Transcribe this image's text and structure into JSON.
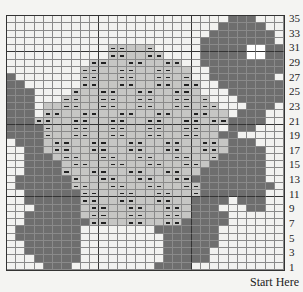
{
  "chart": {
    "cols": 30,
    "rows_count": 35,
    "legend_codes": {
      ".": "background",
      "D": "turtle body (dark)",
      "L": "shell (light)",
      "-": "shell purl stitch",
      "W": "eye (white)"
    },
    "row_labels": [
      "35",
      "33",
      "31",
      "29",
      "27",
      "25",
      "23",
      "21",
      "19",
      "17",
      "15",
      "13",
      "11",
      "9",
      "7",
      "5",
      "3",
      "1"
    ],
    "start_label": "Start Here",
    "rows": [
      "........................DDD...",
      ".......................DDDDD..",
      "......................DDDDDDD.",
      ".....................DDDDDDDD.",
      "...........--LL-.....DDDDDWWDD",
      "...........--LL--....DDDDDWWDD",
      ".........--LL--LL--..DDDDDDDDD",
      "........--LL--LL--LL..DDDDDDDD",
      "D.......--LL--LL--L-..DDDDDDD.",
      "DD......--LL--LL--L--..DDDDDDD",
      "DDD....-LL--LL--LL--L...DDDDDD",
      "DDD...--LL--LL--LL--L-...DDDDD",
      "DDD.LL--LL--LL--LL--L--...DDD.",
      "DDD.--LL--LL--LL--LL--LL.DDD..",
      "DDD--LL--LL--LL--LL--L--DDDD..",
      "DDDD-LL--LL--LL--LL--LL.DDD...",
      "DDDD-LL--LL--LL--LL--LLDD.....",
      ".DDDL--LL--LL--LL--LL--LDDD...",
      "..DDL--LL--LL--LL--LL--LDDDD..",
      "..DDDL--LL--LL--LL--LL-DDDDD..",
      "..DDDDL--LL--LL--LL--LDDDDDD..",
      "..DDDD-LL--LL--LL--LLDDDDDDD..",
      ".DDDDDD-LL--LL--LL--DDDDDDDD..",
      ".DDDDDD--LL--LL--LL--DDDDDDDD.",
      "..DDDDDD--LL--LL--LL-DDDDDDD..",
      "..DDDDDD--LL--LL--LLDDDD.DDD..",
      "...DDDDDL--LL--LL--LDDD...DD..",
      "..DDDDDDL--LL--LL--LDDDD......",
      "..DDDDDDD--LL--LL--DDDDD......",
      ".DDDDDDD........DDDDDDD.......",
      ".DDDDDDD.........DDDDDD.......",
      "..DDDDDD.........DDDDDD.......",
      "..DDDDDD.........DDDDD........",
      "...DDDDD.........DDDDD........",
      "....DDD.........DDDD.........."
    ]
  }
}
